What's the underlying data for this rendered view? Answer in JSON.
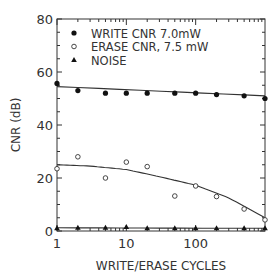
{
  "chart_data": {
    "type": "scatter",
    "title": "",
    "xlabel": "WRITE/ERASE CYCLES",
    "ylabel": "CNR (dB)",
    "xscale": "log",
    "xlim": [
      1,
      1000
    ],
    "ylim": [
      0,
      80
    ],
    "x_ticks": [
      "1",
      "10",
      "100"
    ],
    "y_ticks": [
      "0",
      "20",
      "40",
      "60",
      "80"
    ],
    "grid": false,
    "legend_position": "upper left inside",
    "series": [
      {
        "name": "WRITE CNR 7.0mW",
        "marker": "filled-circle",
        "x": [
          1,
          2,
          5,
          10,
          20,
          50,
          100,
          200,
          500,
          1000
        ],
        "values": [
          55.7,
          53,
          52,
          52,
          52,
          52,
          52,
          51.5,
          51,
          50
        ],
        "fit_line": [
          [
            1,
            54.5
          ],
          [
            1000,
            51
          ]
        ]
      },
      {
        "name": "ERASE CNR, 7.5 mW",
        "marker": "open-circle",
        "x": [
          1,
          2,
          5,
          10,
          20,
          50,
          100,
          200,
          500,
          1000
        ],
        "values": [
          23.5,
          28,
          20,
          26,
          24.3,
          13.2,
          17,
          13,
          8.3,
          4.2
        ],
        "fit_line": [
          [
            1,
            25
          ],
          [
            3,
            24.5
          ],
          [
            10,
            23.2
          ],
          [
            30,
            20.5
          ],
          [
            100,
            17.3
          ],
          [
            300,
            12.5
          ],
          [
            1000,
            5
          ]
        ]
      },
      {
        "name": "NOISE",
        "marker": "filled-triangle",
        "x": [
          1,
          2,
          5,
          10,
          20,
          50,
          100,
          200,
          500,
          1000
        ],
        "values": [
          1,
          1.2,
          1.2,
          1.5,
          1,
          1,
          1,
          1,
          1,
          1
        ],
        "fit_line": [
          [
            1,
            1.2
          ],
          [
            1000,
            1
          ]
        ]
      }
    ]
  }
}
